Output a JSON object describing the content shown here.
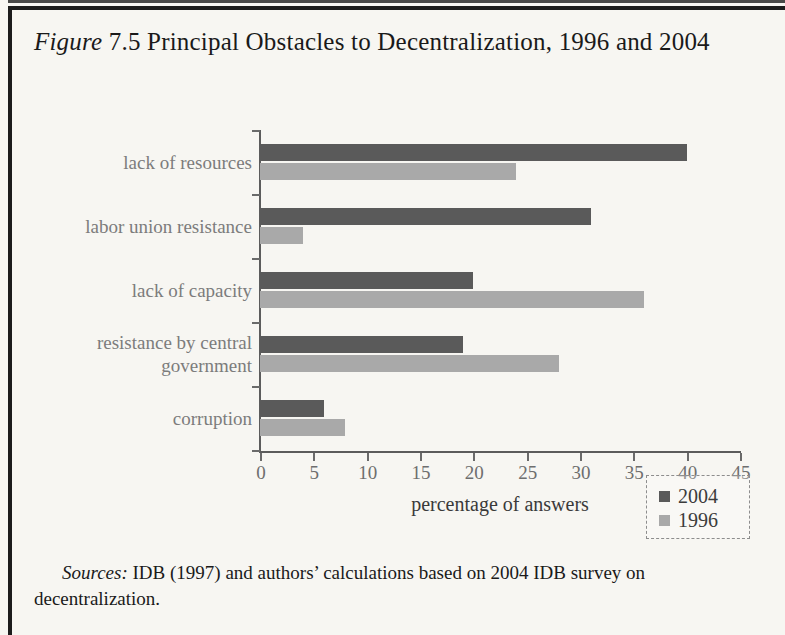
{
  "figure": {
    "label": "Figure",
    "number": "7.5",
    "title": "Principal Obstacles to Decentralization, 1996 and 2004"
  },
  "sources": {
    "label": "Sources:",
    "text": "IDB (1997) and authors’ calculations based on 2004 IDB survey on decentralization."
  },
  "legend": {
    "position": "bottom-right",
    "entries": [
      {
        "name": "2004",
        "color": "#5a5a5a"
      },
      {
        "name": "1996",
        "color": "#a9a9a9"
      }
    ]
  },
  "chart_data": {
    "type": "bar",
    "orientation": "horizontal",
    "title": "Principal Obstacles to Decentralization, 1996 and 2004",
    "xlabel": "percentage of answers",
    "ylabel": "",
    "xlim": [
      0,
      45
    ],
    "xticks": [
      0,
      5,
      10,
      15,
      20,
      25,
      30,
      35,
      40,
      45
    ],
    "xtick_labels": [
      "0",
      "5",
      "10",
      "15",
      "20",
      "25",
      "30",
      "35",
      "40",
      "45"
    ],
    "grid": false,
    "legend_position": "bottom-right",
    "categories": [
      "lack of resources",
      "labor union resistance",
      "lack of capacity",
      "resistance by central government",
      "corruption"
    ],
    "series": [
      {
        "name": "2004",
        "color": "#5a5a5a",
        "values": [
          40,
          31,
          20,
          19,
          6
        ]
      },
      {
        "name": "1996",
        "color": "#a9a9a9",
        "values": [
          24,
          4,
          36,
          28,
          8
        ]
      }
    ]
  }
}
